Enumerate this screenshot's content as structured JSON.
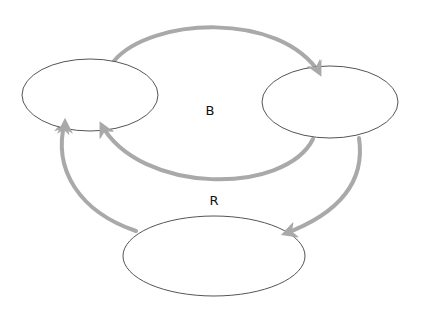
{
  "diagram": {
    "type": "causal-loop",
    "colors": {
      "arrow": "#a9a9a9",
      "node_stroke": "#555555",
      "label": "#111111",
      "background": "#ffffff"
    },
    "nodes": [
      {
        "id": "left",
        "label": ""
      },
      {
        "id": "right",
        "label": ""
      },
      {
        "id": "bottom",
        "label": ""
      }
    ],
    "loops": [
      {
        "label": "B",
        "edges": [
          [
            "left",
            "right"
          ],
          [
            "right",
            "left"
          ]
        ]
      },
      {
        "label": "R",
        "edges": [
          [
            "right",
            "bottom"
          ],
          [
            "bottom",
            "left"
          ]
        ]
      }
    ],
    "labels": {
      "loop_b": "B",
      "loop_r": "R"
    }
  }
}
